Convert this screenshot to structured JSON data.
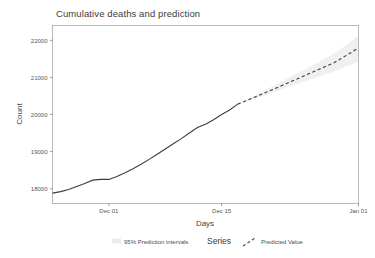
{
  "chart_data": {
    "type": "line",
    "title": "Cumulative deaths and prediction",
    "xlabel": "Days",
    "ylabel": "Count",
    "grid": false,
    "ylim": [
      17600,
      22400
    ],
    "yticks": [
      18000,
      19000,
      20000,
      21000,
      22000
    ],
    "ytick_labels": [
      "18000",
      "19000",
      "20000",
      "21000",
      "22000"
    ],
    "xticks": [
      "Dec 01",
      "Dec 15",
      "Jan 01"
    ],
    "xtick_labels": [
      "Dec 01",
      "Dec 15",
      "Jan 01"
    ],
    "xlim_days": [
      -7,
      31
    ],
    "legend_position": "bottom",
    "legend_title": "Series",
    "series": [
      {
        "name": "Observed",
        "style": "solid",
        "color": "#3d3d3f",
        "x_days": [
          -7,
          -6,
          -5,
          -4,
          -3,
          -2,
          -1,
          0,
          1,
          2,
          3,
          4,
          5,
          6,
          7,
          8,
          9,
          10,
          11,
          12,
          13,
          14,
          15,
          16
        ],
        "values": [
          17880,
          17920,
          17980,
          18060,
          18140,
          18230,
          18250,
          18250,
          18330,
          18430,
          18540,
          18660,
          18790,
          18930,
          19070,
          19210,
          19350,
          19500,
          19650,
          19740,
          19860,
          20000,
          20120,
          20280
        ]
      },
      {
        "name": "Predicted Value",
        "style": "dashed",
        "color": "#3d3d3f",
        "x_days": [
          16,
          18,
          20,
          22,
          24,
          26,
          28,
          29,
          30,
          31
        ],
        "values": [
          20280,
          20460,
          20640,
          20830,
          21020,
          21210,
          21400,
          21530,
          21660,
          21800
        ]
      }
    ],
    "interval_band": {
      "name": "95% Prediction intervals",
      "color": "#e7e7e7",
      "x_days": [
        16,
        18,
        20,
        22,
        24,
        26,
        28,
        29,
        30,
        31
      ],
      "lower": [
        20280,
        20420,
        20560,
        20720,
        20870,
        21020,
        21160,
        21250,
        21340,
        21430
      ],
      "upper": [
        20280,
        20500,
        20720,
        20950,
        21180,
        21410,
        21650,
        21800,
        21960,
        22140
      ]
    }
  },
  "legend": {
    "interval_label": "95% Prediction intervals",
    "title": "Series",
    "predicted_label": "Predicted Value"
  },
  "axes": {
    "y_title": "Count",
    "x_title": "Days"
  }
}
